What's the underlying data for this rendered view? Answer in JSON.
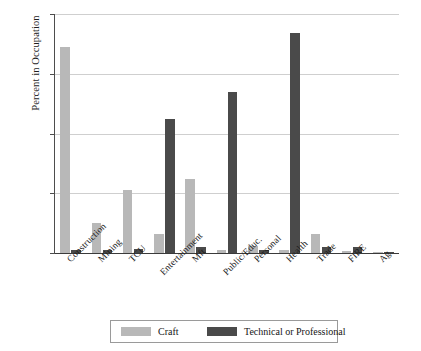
{
  "chart_data": {
    "type": "bar",
    "title": "",
    "xlabel": "",
    "ylabel": "Percent in Occupation",
    "ylim": [
      0,
      80
    ],
    "yticks": [
      0,
      20,
      40,
      60,
      80
    ],
    "grid": true,
    "legend_position": "bottom",
    "categories": [
      "Construction",
      "Mining",
      "TCU",
      "Entertainment",
      "Mft",
      "Public/Educ.",
      "Personal",
      "Health",
      "Trade",
      "FIRE",
      "Ag"
    ],
    "series": [
      {
        "name": "Craft",
        "color": "#b8b8b8",
        "values": [
          69,
          10,
          21,
          6.5,
          24.7,
          1,
          2.5,
          1,
          6.5,
          0.7,
          0.3
        ]
      },
      {
        "name": "Technical or Professional",
        "color": "#4a4a4a",
        "values": [
          1,
          1,
          1.5,
          45,
          2,
          54,
          1,
          73.8,
          2,
          2,
          0.3
        ]
      }
    ]
  },
  "axes": {
    "y_title": "Percent in Occupation",
    "y_tick_labels": [
      "0",
      "20",
      "40",
      "60",
      "80"
    ],
    "x_tick_labels": [
      "Construction",
      "Mining",
      "TCU",
      "Entertainment",
      "Mft",
      "Public/Educ.",
      "Personal",
      "Health",
      "Trade",
      "FIRE",
      "Ag"
    ]
  },
  "legend": {
    "items": [
      {
        "label": "Craft",
        "color": "#b8b8b8"
      },
      {
        "label": "Technical or Professional",
        "color": "#4a4a4a"
      }
    ]
  }
}
